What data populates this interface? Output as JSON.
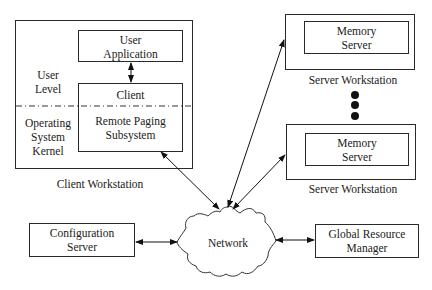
{
  "client_workstation": {
    "label": "Client Workstation",
    "user_level_label_line1": "User",
    "user_level_label_line2": "Level",
    "kernel_label_line1": "Operating",
    "kernel_label_line2": "System",
    "kernel_label_line3": "Kernel",
    "user_application": {
      "line1": "User",
      "line2": "Application"
    },
    "client": {
      "title": "Client",
      "subsystem_line1": "Remote Paging",
      "subsystem_line2": "Subsystem"
    }
  },
  "server_workstations": [
    {
      "label": "Server Workstation",
      "inner_line1": "Memory",
      "inner_line2": "Server"
    },
    {
      "label": "Server Workstation",
      "inner_line1": "Memory",
      "inner_line2": "Server"
    }
  ],
  "ellipsis_dots": 3,
  "configuration_server": {
    "line1": "Configuration",
    "line2": "Server"
  },
  "network": {
    "label": "Network"
  },
  "global_resource_manager": {
    "line1": "Global Resource",
    "line2": "Manager"
  }
}
